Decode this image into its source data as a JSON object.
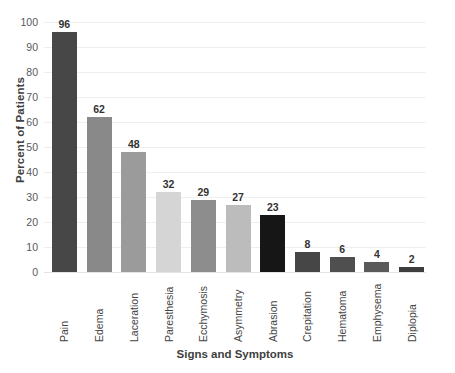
{
  "chart_data": {
    "type": "bar",
    "title": "",
    "xlabel": "Signs and Symptoms",
    "ylabel": "Percent of Patients",
    "categories": [
      "Pain",
      "Edema",
      "Laceration",
      "Paresthesia",
      "Ecchymosis",
      "Asymmetry",
      "Abrasion",
      "Crepitation",
      "Hematoma",
      "Emphysema",
      "Diplopia"
    ],
    "values": [
      96,
      62,
      48,
      32,
      29,
      27,
      23,
      8,
      6,
      4,
      2
    ],
    "bar_colors": [
      "#474747",
      "#898989",
      "#9b9b9b",
      "#d5d5d5",
      "#8d8d8d",
      "#bcbcbc",
      "#161616",
      "#464646",
      "#4f4f4f",
      "#5a5a5a",
      "#3d3d3d"
    ],
    "value_labels": [
      "96",
      "62",
      "48",
      "32",
      "29",
      "27",
      "23",
      "8",
      "6",
      "4",
      "2"
    ],
    "ylim": [
      0,
      100
    ],
    "ytick_labels": [
      "0",
      "10",
      "20",
      "30",
      "40",
      "50",
      "60",
      "70",
      "80",
      "90",
      "100"
    ],
    "ytick_values": [
      0,
      10,
      20,
      30,
      40,
      50,
      60,
      70,
      80,
      90,
      100
    ],
    "grid": true,
    "grid_color": "#efefef",
    "legend": false,
    "background": "#ffffff"
  }
}
